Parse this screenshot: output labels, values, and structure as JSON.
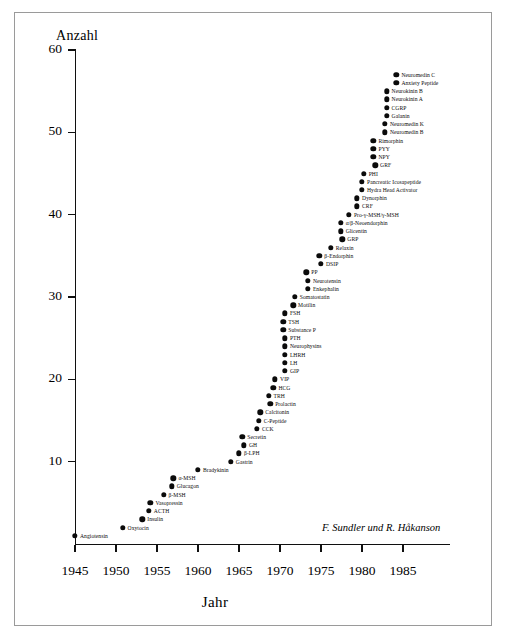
{
  "figure": {
    "attribution": "F. Sundler und R. Håkanson"
  },
  "chart_data": {
    "type": "scatter",
    "title": "",
    "xlabel": "Jahr",
    "ylabel": "Anzahl",
    "xlim": [
      1943,
      1988
    ],
    "ylim": [
      0,
      60
    ],
    "xticks": [
      1945,
      1950,
      1955,
      1960,
      1965,
      1970,
      1975,
      1980,
      1985
    ],
    "xtick_labels": [
      "1945",
      "1950",
      "1955",
      "1960",
      "1965",
      "1970",
      "1975",
      "1980",
      "1985"
    ],
    "yticks": [
      10,
      20,
      30,
      40,
      50,
      60
    ],
    "ytick_labels": [
      "10",
      "20",
      "30",
      "40",
      "50",
      "60"
    ],
    "grid": false,
    "legend": false,
    "marker": "filled-circle",
    "marker_color": "#0b0b0b",
    "points": [
      {
        "label": "Angiotensin",
        "x": 1945,
        "y": 1,
        "label_side": "right"
      },
      {
        "label": "Oxytocin",
        "x": 1950.8,
        "y": 2,
        "label_side": "right"
      },
      {
        "label": "Insulin",
        "x": 1953.2,
        "y": 3,
        "label_side": "right"
      },
      {
        "label": "ACTH",
        "x": 1954.0,
        "y": 4,
        "label_side": "right"
      },
      {
        "label": "Vasopressin",
        "x": 1954.2,
        "y": 5,
        "label_side": "right"
      },
      {
        "label": "β-MSH",
        "x": 1955.8,
        "y": 6,
        "label_side": "right"
      },
      {
        "label": "Glucagon",
        "x": 1956.8,
        "y": 7,
        "label_side": "right"
      },
      {
        "label": "α-MSH",
        "x": 1957.0,
        "y": 8,
        "label_side": "right"
      },
      {
        "label": "Bradykinin",
        "x": 1960.0,
        "y": 9,
        "label_side": "right"
      },
      {
        "label": "Gastrin",
        "x": 1964.0,
        "y": 10,
        "label_side": "right"
      },
      {
        "label": "β-LPH",
        "x": 1965.0,
        "y": 11,
        "label_side": "right"
      },
      {
        "label": "GH",
        "x": 1965.6,
        "y": 12,
        "label_side": "right"
      },
      {
        "label": "Secretin",
        "x": 1965.4,
        "y": 13,
        "label_side": "right"
      },
      {
        "label": "CCK",
        "x": 1967.2,
        "y": 14,
        "label_side": "right"
      },
      {
        "label": "C-Peptide",
        "x": 1967.4,
        "y": 15,
        "label_side": "right"
      },
      {
        "label": "Calcitonin",
        "x": 1967.6,
        "y": 16,
        "label_side": "right"
      },
      {
        "label": "Prolactin",
        "x": 1968.8,
        "y": 17,
        "label_side": "right"
      },
      {
        "label": "TRH",
        "x": 1968.6,
        "y": 18,
        "label_side": "right"
      },
      {
        "label": "HCG",
        "x": 1969.2,
        "y": 19,
        "label_side": "right"
      },
      {
        "label": "VIP",
        "x": 1969.4,
        "y": 20,
        "label_side": "right"
      },
      {
        "label": "GIP",
        "x": 1970.6,
        "y": 21,
        "label_side": "right"
      },
      {
        "label": "LH",
        "x": 1970.6,
        "y": 22,
        "label_side": "right"
      },
      {
        "label": "LHRH",
        "x": 1970.6,
        "y": 23,
        "label_side": "right"
      },
      {
        "label": "Neurophysins",
        "x": 1970.6,
        "y": 24,
        "label_side": "right"
      },
      {
        "label": "PTH",
        "x": 1970.6,
        "y": 25,
        "label_side": "right"
      },
      {
        "label": "Substance P",
        "x": 1970.4,
        "y": 26,
        "label_side": "right"
      },
      {
        "label": "TSH",
        "x": 1970.4,
        "y": 27,
        "label_side": "right"
      },
      {
        "label": "FSH",
        "x": 1970.6,
        "y": 28,
        "label_side": "right"
      },
      {
        "label": "Motilin",
        "x": 1971.6,
        "y": 29,
        "label_side": "right"
      },
      {
        "label": "Somatostatin",
        "x": 1971.8,
        "y": 30,
        "label_side": "right"
      },
      {
        "label": "Enkephalin",
        "x": 1973.4,
        "y": 31,
        "label_side": "right"
      },
      {
        "label": "Neurotensin",
        "x": 1973.4,
        "y": 32,
        "label_side": "right"
      },
      {
        "label": "PP",
        "x": 1973.2,
        "y": 33,
        "label_side": "right"
      },
      {
        "label": "DSIP",
        "x": 1975.0,
        "y": 34,
        "label_side": "right"
      },
      {
        "label": "β-Endorphin",
        "x": 1974.8,
        "y": 35,
        "label_side": "right"
      },
      {
        "label": "Relaxin",
        "x": 1976.2,
        "y": 36,
        "label_side": "right"
      },
      {
        "label": "GRP",
        "x": 1977.6,
        "y": 37,
        "label_side": "right"
      },
      {
        "label": "Glicentin",
        "x": 1977.4,
        "y": 38,
        "label_side": "right"
      },
      {
        "label": "α/β-Neoendorphin",
        "x": 1977.4,
        "y": 39,
        "label_side": "right"
      },
      {
        "label": "Pro-γ-MSH/γ-MSH",
        "x": 1978.4,
        "y": 40,
        "label_side": "right"
      },
      {
        "label": "CRF",
        "x": 1979.4,
        "y": 41,
        "label_side": "right"
      },
      {
        "label": "Dynorphin",
        "x": 1979.4,
        "y": 42,
        "label_side": "right"
      },
      {
        "label": "Hydra Head Activator",
        "x": 1980.0,
        "y": 43,
        "label_side": "right"
      },
      {
        "label": "Pancreatic Icosapeptide",
        "x": 1980.0,
        "y": 44,
        "label_side": "right"
      },
      {
        "label": "PHI",
        "x": 1980.2,
        "y": 45,
        "label_side": "right"
      },
      {
        "label": "GRF",
        "x": 1981.6,
        "y": 46,
        "label_side": "right"
      },
      {
        "label": "NPY",
        "x": 1981.4,
        "y": 47,
        "label_side": "right"
      },
      {
        "label": "PYY",
        "x": 1981.4,
        "y": 48,
        "label_side": "right"
      },
      {
        "label": "Rimorphin",
        "x": 1981.4,
        "y": 49,
        "label_side": "right"
      },
      {
        "label": "Neuromedin B",
        "x": 1982.8,
        "y": 50,
        "label_side": "right"
      },
      {
        "label": "Neuromedin K",
        "x": 1982.8,
        "y": 51,
        "label_side": "right"
      },
      {
        "label": "Galanin",
        "x": 1983.0,
        "y": 52,
        "label_side": "right"
      },
      {
        "label": "CGRP",
        "x": 1983.0,
        "y": 53,
        "label_side": "right"
      },
      {
        "label": "Neurokinin A",
        "x": 1983.0,
        "y": 54,
        "label_side": "right"
      },
      {
        "label": "Neurokinin B",
        "x": 1983.0,
        "y": 55,
        "label_side": "right"
      },
      {
        "label": "Anxiety Peptide",
        "x": 1984.2,
        "y": 56,
        "label_side": "right"
      },
      {
        "label": "Neuromedin C",
        "x": 1984.2,
        "y": 57,
        "label_side": "right"
      }
    ]
  }
}
